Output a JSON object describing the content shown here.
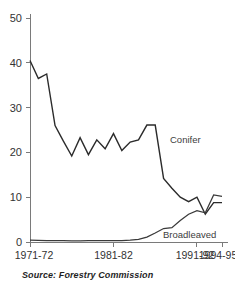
{
  "chart_data": {
    "type": "line",
    "title": "",
    "subtitle": "",
    "xlabel": "",
    "ylabel": "",
    "xlim": [
      0,
      23
    ],
    "ylim": [
      0,
      50
    ],
    "grid": false,
    "legend_position": "inline-annotation",
    "x": [
      "1971-72",
      "1972-73",
      "1973-74",
      "1974-75",
      "1975-76",
      "1976-77",
      "1977-78",
      "1978-79",
      "1979-80",
      "1980-81",
      "1981-82",
      "1982-83",
      "1983-84",
      "1984-85",
      "1985-86",
      "1986-87",
      "1987-88",
      "1988-89",
      "1989-90",
      "1990-91",
      "1991-92",
      "1992-93",
      "1993-94",
      "1994-95"
    ],
    "x_tick_labels": [
      "1971-72",
      "1981-82",
      "1991-92",
      "1994-95"
    ],
    "x_tick_indices": [
      0,
      10,
      20,
      23
    ],
    "y_tick_labels": [
      "0",
      "10",
      "20",
      "30",
      "40",
      "50"
    ],
    "y_tick_values": [
      0,
      10,
      20,
      30,
      40,
      50
    ],
    "series": [
      {
        "name": "Conifer",
        "annotation": "Conifer",
        "values": [
          40.5,
          36.5,
          37.5,
          26.0,
          22.5,
          19.2,
          23.3,
          19.5,
          22.8,
          20.8,
          24.2,
          20.4,
          22.3,
          22.8,
          26.1,
          26.1,
          14.2,
          12.0,
          10.0,
          9.0,
          10.0,
          6.2,
          8.8,
          8.8
        ]
      },
      {
        "name": "Broadleaved",
        "annotation": "Broadleaved",
        "values": [
          0.4,
          0.35,
          0.3,
          0.3,
          0.3,
          0.25,
          0.25,
          0.3,
          0.3,
          0.3,
          0.3,
          0.3,
          0.4,
          0.6,
          1.1,
          2.0,
          3.0,
          3.2,
          4.8,
          6.2,
          7.0,
          6.5,
          10.5,
          10.2
        ]
      }
    ]
  },
  "source_note": "Source: Forestry Commission"
}
